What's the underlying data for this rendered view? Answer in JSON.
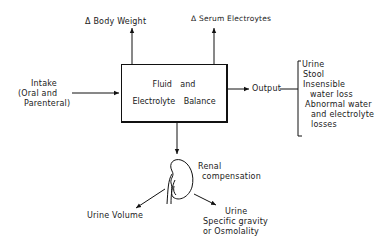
{
  "diagram": {
    "top_labels": {
      "body_weight": "Δ Body Weight",
      "serum_electrolytes": "Δ Serum Electroytes"
    },
    "intake": {
      "line1": "Intake",
      "line2": "(Oral and",
      "line3": "Parenteral)"
    },
    "center_box": {
      "line1": "Fluid and",
      "line2": "Electrolyte Balance"
    },
    "output_label": "Output",
    "output_items": {
      "urine": "Urine",
      "stool": "Stool",
      "insensible_1": "Insensible",
      "insensible_2": "water loss",
      "abnormal_1": "Abnormal water",
      "abnormal_2": "and electrolyte",
      "abnormal_3": "losses"
    },
    "renal": {
      "line1": "Renal",
      "line2": "compensation",
      "icon": "kidney-icon"
    },
    "urine_volume": "Urine Volume",
    "urine_sg": {
      "line1": "Urine",
      "line2": "Specific gravity",
      "line3": "or Osmolality"
    },
    "colors": {
      "ink": "#111111",
      "background": "#ffffff"
    }
  }
}
